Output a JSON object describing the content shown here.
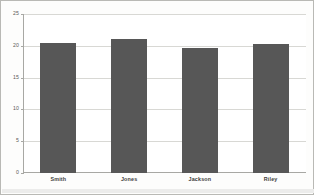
{
  "chart_data": {
    "type": "bar",
    "title": "",
    "subtitle": "",
    "xlabel": "",
    "ylabel": "",
    "categories": [
      "Smith",
      "Jones",
      "Jackson",
      "Riley"
    ],
    "values": [
      20.5,
      21.0,
      19.7,
      20.3
    ],
    "series": [
      {
        "name": "",
        "values": [
          20.5,
          21.0,
          19.7,
          20.3
        ]
      }
    ],
    "ylim": [
      0,
      25
    ],
    "yticks": [
      0,
      5,
      10,
      15,
      20,
      25
    ],
    "ytick_labels": [
      "0",
      "5",
      "10",
      "15",
      "20",
      "25"
    ],
    "grid": true,
    "grid_axis": "y",
    "legend": false,
    "legend_position": "none",
    "bar_color": "#575757",
    "plot_background": "#ffffff",
    "page_background": "#fdfdfc",
    "frame_border_color": "#b9b9b5",
    "gridline_color": "#d8d8d4",
    "axis_color": "#a8a8a4",
    "annotations": []
  }
}
